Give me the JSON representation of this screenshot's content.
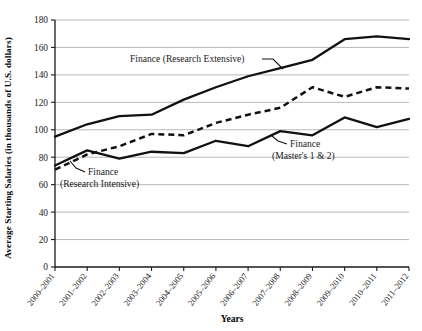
{
  "chart_data": {
    "type": "line",
    "title": "",
    "xlabel": "Years",
    "ylabel": "Average Starting Salaries (in thousands of U.S. dollars)",
    "categories": [
      "2000–2001",
      "2001–2002",
      "2002–2003",
      "2003–2004",
      "2004–2005",
      "2005–2006",
      "2006–2007",
      "2007–2008",
      "2008–2009",
      "2009–2010",
      "2010–2011",
      "2011–2012"
    ],
    "ylim": [
      0,
      180
    ],
    "yticks": [
      0,
      20,
      40,
      60,
      80,
      100,
      120,
      140,
      160,
      180
    ],
    "grid": true,
    "legend_position": "inline-annotations",
    "series": [
      {
        "name": "Finance (Research Extensive)",
        "style": "solid",
        "values": [
          95,
          104,
          110,
          111,
          122,
          131,
          139,
          145,
          151,
          166,
          168,
          166
        ]
      },
      {
        "name": "Finance (Research Intensive)",
        "style": "dashed",
        "values": [
          71,
          82,
          88,
          97,
          96,
          105,
          111,
          116,
          131,
          124,
          131,
          130
        ]
      },
      {
        "name": "Finance (Master's 1 & 2)",
        "style": "solid",
        "values": [
          74,
          85,
          79,
          84,
          83,
          92,
          88,
          99,
          96,
          109,
          102,
          108
        ]
      }
    ],
    "annotations": [
      {
        "id": "anno-research-extensive",
        "lines": [
          "Finance (Research Extensive)"
        ]
      },
      {
        "id": "anno-research-intensive",
        "lines": [
          "Finance",
          "(Research Intensive)"
        ]
      },
      {
        "id": "anno-masters",
        "lines": [
          "Finance",
          "(Master's 1 & 2)"
        ]
      }
    ]
  },
  "axis": {
    "y_tick_labels": [
      "180",
      "160",
      "140",
      "120",
      "100",
      "80",
      "60",
      "40",
      "20",
      "0"
    ],
    "x_tick_labels": [
      "2000–2001",
      "2001–2002",
      "2002–2003",
      "2003–2004",
      "2004–2005",
      "2005–2006",
      "2006–2007",
      "2007–2008",
      "2008–2009",
      "2009–2010",
      "2010–2011",
      "2011–2012"
    ],
    "y_title": "Average Starting Salaries (in thousands of U.S. dollars)",
    "x_title": "Years"
  },
  "annotations": {
    "extensive": "Finance (Research Extensive)",
    "intensive_l1": "Finance",
    "intensive_l2": "(Research Intensive)",
    "masters_l1": "Finance",
    "masters_l2": "(Master's 1 & 2)"
  },
  "colors": {
    "line": "#111111",
    "grid": "#9a9a9a",
    "axis": "#1a1a1a",
    "background": "#ffffff"
  }
}
